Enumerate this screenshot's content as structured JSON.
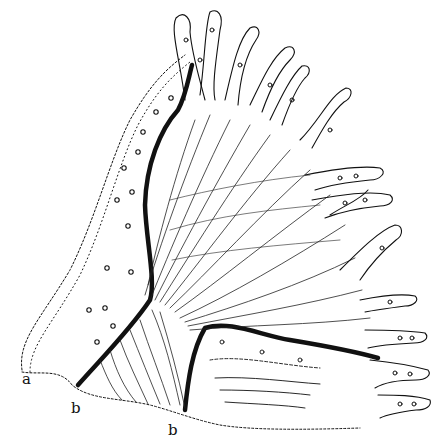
{
  "figure": {
    "kind": "histological line drawing",
    "colors": {
      "ink": "#111111",
      "background": "#ffffff"
    },
    "labels": [
      {
        "text": "a",
        "x": 22,
        "y": 372
      },
      {
        "text": "b",
        "x": 71,
        "y": 401
      },
      {
        "text": "b",
        "x": 168,
        "y": 423
      }
    ]
  }
}
